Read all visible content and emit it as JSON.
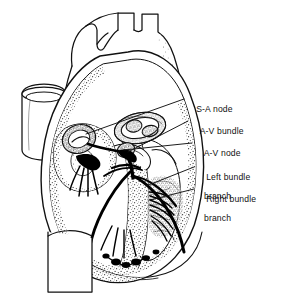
{
  "figure": {
    "kind": "anatomical-line-drawing",
    "background_color": "#ffffff",
    "ink_color": "#111111",
    "width": 294,
    "height": 307
  },
  "labels": [
    {
      "id": "sa-node",
      "line1": "S-A node",
      "line2": ""
    },
    {
      "id": "av-bundle",
      "line1": "A-V bundle",
      "line2": ""
    },
    {
      "id": "av-node",
      "line1": "A-V node",
      "line2": ""
    },
    {
      "id": "left-bundle-branch",
      "line1": "Left bundle",
      "line2": "branch"
    },
    {
      "id": "right-bundle-branch",
      "line1": "Right bundle",
      "line2": "branch"
    }
  ]
}
